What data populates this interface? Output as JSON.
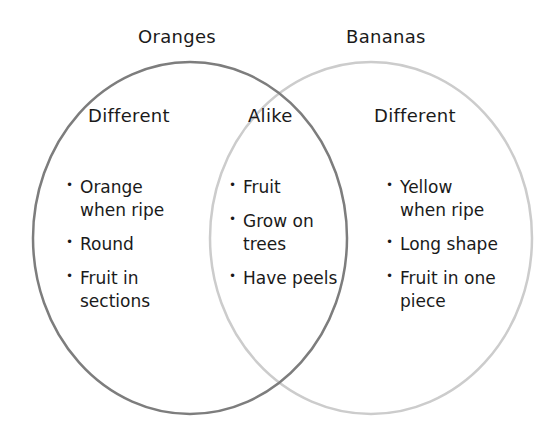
{
  "diagram": {
    "type": "venn",
    "sets": [
      {
        "title": "Oranges",
        "region_heading": "Different",
        "items": [
          "Orange\nwhen ripe",
          "Round",
          "Fruit in\nsections"
        ],
        "stroke": "#7a7a7a"
      },
      {
        "title": "Bananas",
        "region_heading": "Different",
        "items": [
          "Yellow\nwhen ripe",
          "Long shape",
          "Fruit in one\npiece"
        ],
        "stroke": "#c8c8c8"
      }
    ],
    "overlap": {
      "heading": "Alike",
      "items": [
        "Fruit",
        "Grow on\ntrees",
        "Have peels"
      ]
    }
  }
}
